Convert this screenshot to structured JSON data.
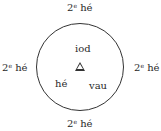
{
  "diagram": {
    "outer_labels": {
      "top": {
        "num": "2",
        "sup": "e",
        "word": "hé"
      },
      "left": {
        "num": "2",
        "sup": "e",
        "word": "hé"
      },
      "right": {
        "num": "2",
        "sup": "e",
        "word": "hé"
      },
      "bottom": {
        "num": "2",
        "sup": "e",
        "word": "hé"
      }
    },
    "inner_labels": {
      "top": "iod",
      "bottom_left": "hé",
      "bottom_right": "vau"
    },
    "center_symbol": "triangle"
  }
}
